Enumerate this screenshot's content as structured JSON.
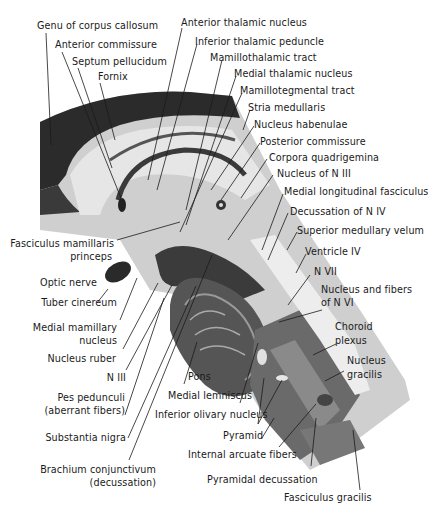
{
  "figure": {
    "labels": {
      "genu_corpus_callosum": "Genu of corpus callosum",
      "anterior_commissure": "Anterior commissure",
      "septum_pellucidum": "Septum pellucidum",
      "fornix": "Fornix",
      "anterior_thalamic_nucleus": "Anterior thalamic nucleus",
      "inferior_thalamic_peduncle": "Inferior thalamic peduncle",
      "mamillothalamic_tract": "Mamillothalamic tract",
      "medial_thalamic_nucleus": "Medial thalamic nucleus",
      "mamillotegmental_tract": "Mamillotegmental tract",
      "stria_medullaris": "Stria medullaris",
      "nucleus_habenulae": "Nucleus habenulae",
      "posterior_commissure": "Posterior commissure",
      "corpora_quadrigemina": "Corpora quadrigemina",
      "nucleus_n_iii": "Nucleus of N III",
      "medial_longitudinal_fasciculus": "Medial longitudinal fasciculus",
      "decussation_n_iv": "Decussation of N IV",
      "superior_medullary_velum": "Superior medullary velum",
      "ventricle_iv": "Ventricle IV",
      "n_vii": "N VII",
      "nucleus_fibers_n_vi_1": "Nucleus and fibers",
      "nucleus_fibers_n_vi_2": "of N VI",
      "choroid_plexus_1": "Choroid",
      "choroid_plexus_2": "plexus",
      "nucleus_gracilis_1": "Nucleus",
      "nucleus_gracilis_2": "gracilis",
      "fasciculus_mamillaris_1": "Fasciculus mamillaris",
      "fasciculus_mamillaris_2": "princeps",
      "optic_nerve": "Optic nerve",
      "tuber_cinereum": "Tuber cinereum",
      "medial_mamillary_1": "Medial mamillary",
      "medial_mamillary_2": "nucleus",
      "nucleus_ruber": "Nucleus ruber",
      "n_iii": "N III",
      "pes_pedunculi_1": "Pes pedunculi",
      "pes_pedunculi_2": "(aberrant fibers)",
      "substantia_nigra": "Substantia nigra",
      "brachium_1": "Brachium conjunctivum",
      "brachium_2": "(decussation)",
      "pons": "Pons",
      "medial_lemniscus": "Medial lemniscus",
      "inferior_olivary_nucleus": "Inferior olivary nucleus",
      "pyramid": "Pyramid",
      "internal_arcuate_fibers": "Internal arcuate fibers",
      "pyramidal_decussation": "Pyramidal decussation",
      "fasciculus_gracilis": "Fasciculus gracilis"
    },
    "colors": {
      "ink": "#1a1a1a",
      "tissue_dark": "#2a2a2a",
      "tissue_mid": "#8a8a8a",
      "tissue_light": "#d6d6d6",
      "background": "#ffffff"
    }
  }
}
